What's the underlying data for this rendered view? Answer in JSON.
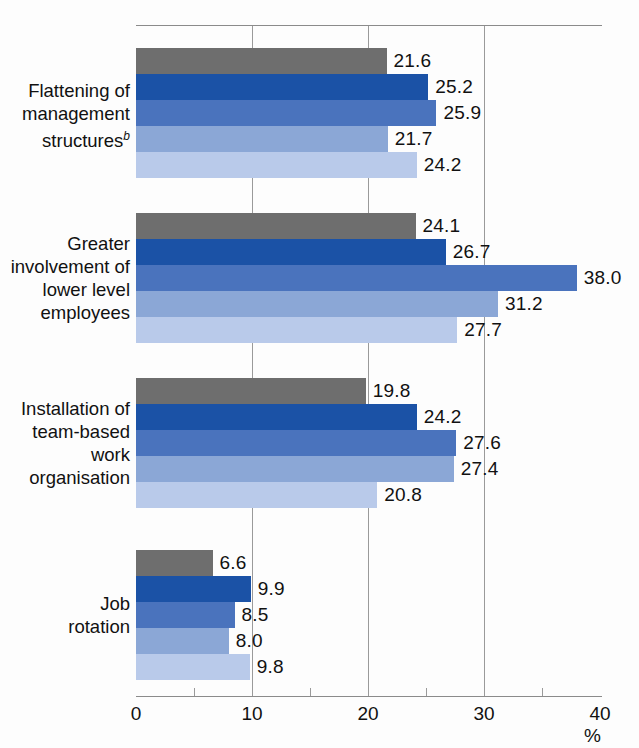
{
  "chart_data": {
    "type": "bar",
    "orientation": "horizontal",
    "title": "",
    "subtitle": "",
    "xlabel": "%",
    "ylabel": "",
    "xlim": [
      0,
      40
    ],
    "xticks": [
      0,
      10,
      20,
      30,
      40
    ],
    "xtick_labels": [
      "0",
      "10",
      "20",
      "30",
      "40"
    ],
    "minor_xticks": [
      5,
      15,
      25,
      35
    ],
    "grid": "vertical gridlines at 10, 20, 30",
    "legend": "none",
    "legend_position": "none",
    "categories": [
      "Flattening of management structures",
      "Greater involvement of lower level employees",
      "Installation of team-based work organisation",
      "Job rotation"
    ],
    "category_lines": [
      [
        "Flattening of",
        "management",
        "structures"
      ],
      [
        "Greater",
        "involvement of",
        "lower level",
        "employees"
      ],
      [
        "Installation of",
        "team-based",
        "work",
        "organisation"
      ],
      [
        "Job",
        "rotation"
      ]
    ],
    "category_footnotes": [
      "b",
      "",
      "",
      ""
    ],
    "series": [
      {
        "name": "series-1",
        "color": "#6e6e6e",
        "values": [
          21.6,
          24.1,
          19.8,
          6.6
        ]
      },
      {
        "name": "series-2",
        "color": "#1b52a6",
        "values": [
          25.2,
          26.7,
          24.2,
          9.9
        ]
      },
      {
        "name": "series-3",
        "color": "#4a73bd",
        "values": [
          25.9,
          38.0,
          27.6,
          8.5
        ]
      },
      {
        "name": "series-4",
        "color": "#8ba7d6",
        "values": [
          21.7,
          31.2,
          27.4,
          8.0
        ]
      },
      {
        "name": "series-5",
        "color": "#b9caea",
        "values": [
          24.2,
          27.7,
          20.8,
          9.8
        ]
      }
    ],
    "value_labels": [
      [
        "21.6",
        "25.2",
        "25.9",
        "21.7",
        "24.2"
      ],
      [
        "24.1",
        "26.7",
        "38.0",
        "31.2",
        "27.7"
      ],
      [
        "19.8",
        "24.2",
        "27.6",
        "27.4",
        "20.8"
      ],
      [
        "6.6",
        "9.9",
        "8.5",
        "8.0",
        "9.8"
      ]
    ]
  },
  "axis": {
    "unit_label": "%"
  },
  "colors": {
    "series_1": "#6e6e6e",
    "series_2": "#1b52a6",
    "series_3": "#4a73bd",
    "series_4": "#8ba7d6",
    "series_5": "#b9caea",
    "gridline": "#9a9a9a",
    "axis": "#8b8b8b",
    "text": "#111111",
    "background": "#fdfdfd"
  }
}
